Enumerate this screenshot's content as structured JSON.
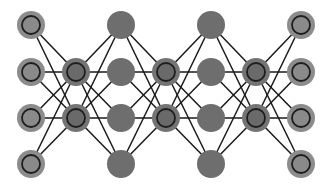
{
  "diagram": {
    "type": "network",
    "title": "",
    "width": 334,
    "height": 190,
    "node_radius": 14,
    "ring_radius": 9,
    "colors": {
      "background": "#ffffff",
      "edge": "#1a1a1a",
      "solid_node": "#6e6e6e",
      "ringed_outer_edge": "#8c8c8c",
      "ringed_inner_edge": "#8a8a8a",
      "ringed_outer_hidden": "#747474",
      "ringed_inner_hidden": "#6a6a6a",
      "ring_stroke": "#1e1e1e"
    },
    "rows_y": [
      25,
      72,
      118,
      164
    ],
    "columns": [
      {
        "id": "col-0",
        "x": 31,
        "style": "ringed-edge",
        "rows": [
          0,
          1,
          2,
          3
        ]
      },
      {
        "id": "col-1",
        "x": 76,
        "style": "ringed-hidden",
        "rows": [
          1,
          2
        ]
      },
      {
        "id": "col-2",
        "x": 121,
        "style": "solid",
        "rows": [
          0,
          1,
          2,
          3
        ]
      },
      {
        "id": "col-3",
        "x": 166,
        "style": "ringed-hidden",
        "rows": [
          1,
          2
        ]
      },
      {
        "id": "col-4",
        "x": 211,
        "style": "solid",
        "rows": [
          0,
          1,
          2,
          3
        ]
      },
      {
        "id": "col-5",
        "x": 256,
        "style": "ringed-hidden",
        "rows": [
          1,
          2
        ]
      },
      {
        "id": "col-6",
        "x": 301,
        "style": "ringed-edge",
        "rows": [
          0,
          1,
          2,
          3
        ]
      }
    ],
    "connections": "fully-connected-between-adjacent-columns"
  }
}
